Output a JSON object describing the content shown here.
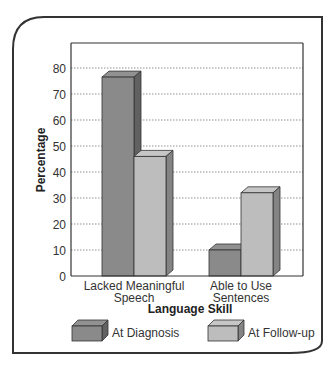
{
  "chart_data": {
    "type": "bar",
    "title": "",
    "xlabel": "Language Skill",
    "ylabel": "Percentage",
    "ylim": [
      0,
      80
    ],
    "yticks": [
      0,
      10,
      20,
      30,
      40,
      50,
      60,
      70,
      80
    ],
    "grid": "horizontal dotted",
    "legend_position": "bottom",
    "categories": [
      [
        "Lacked Meaningful",
        "Speech"
      ],
      [
        "Able to Use",
        "Sentences"
      ]
    ],
    "series": [
      {
        "name": "At Diagnosis",
        "values": [
          76.5,
          10
        ],
        "color": "#8a8a8a"
      },
      {
        "name": "At Follow-up",
        "values": [
          46,
          32
        ],
        "color": "#bdbdbd"
      }
    ]
  }
}
